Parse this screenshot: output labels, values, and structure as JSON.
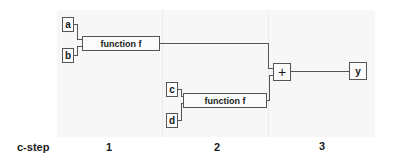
{
  "diagram": {
    "inputs": [
      {
        "id": "a",
        "label": "a"
      },
      {
        "id": "b",
        "label": "b"
      },
      {
        "id": "c",
        "label": "c"
      },
      {
        "id": "d",
        "label": "d"
      }
    ],
    "functions": [
      {
        "id": "f1",
        "label": "function f",
        "inputs": [
          "a",
          "b"
        ]
      },
      {
        "id": "f2",
        "label": "function f",
        "inputs": [
          "c",
          "d"
        ]
      }
    ],
    "adder": {
      "label": "+",
      "inputs": [
        "f1",
        "f2"
      ]
    },
    "output": {
      "label": "y"
    }
  },
  "axis": {
    "title": "c-step",
    "steps": [
      "1",
      "2",
      "3"
    ]
  }
}
